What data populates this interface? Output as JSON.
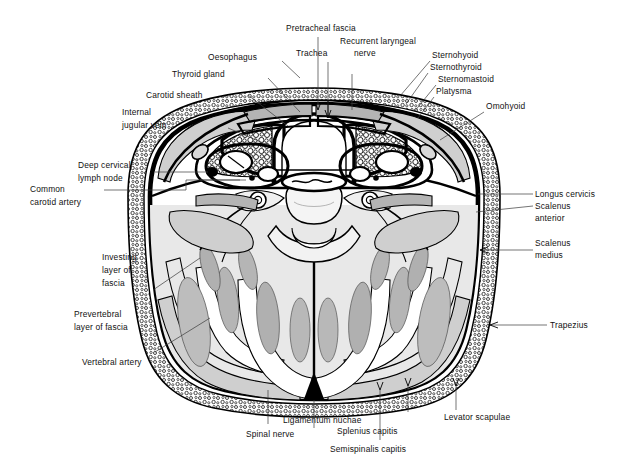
{
  "figure": {
    "background_color": "#ffffff",
    "ink_color": "#000000",
    "muscle_fill": "#cfcfcf",
    "muscle_fill_dark": "#b4b4b4",
    "pale_fill": "#e8e8e8",
    "leader_color": "#3a3a3a"
  },
  "labels": {
    "pretracheal_fascia": "Pretracheal fascia",
    "trachea": "Trachea",
    "recurrent_laryngeal_1": "Recurrent laryngeal",
    "recurrent_laryngeal_2": "nerve",
    "oesophagus": "Oesophagus",
    "thyroid_gland": "Thyroid gland",
    "carotid_sheath": "Carotid sheath",
    "internal_jugular_1": "Internal",
    "internal_jugular_2": "jugular vein",
    "deep_cervical_1": "Deep cervical",
    "deep_cervical_2": "lymph node",
    "common_carotid_1": "Common",
    "common_carotid_2": "carotid artery",
    "investing_1": "Investing",
    "investing_2": "layer of",
    "investing_3": "fascia",
    "prevertebral_1": "Prevertebral",
    "prevertebral_2": "layer of fascia",
    "vertebral_artery": "Vertebral artery",
    "sternohyoid": "Sternohyoid",
    "sternothyroid": "Sternothyroid",
    "sternomastoid": "Sternomastoid",
    "platysma": "Platysma",
    "omohyoid": "Omohyoid",
    "longus_cervicis": "Longus cervicis",
    "scalenus_anterior_1": "Scalenus",
    "scalenus_anterior_2": "anterior",
    "scalenus_medius_1": "Scalenus",
    "scalenus_medius_2": "medius",
    "trapezius": "Trapezius",
    "levator_scapulae": "Levator scapulae",
    "splenius_capitis": "Splenius capitis",
    "semispinalis_capitis": "Semispinalis capitis",
    "ligamentum_nuchae": "Ligamentum nuchae",
    "spinal_nerve": "Spinal nerve"
  }
}
